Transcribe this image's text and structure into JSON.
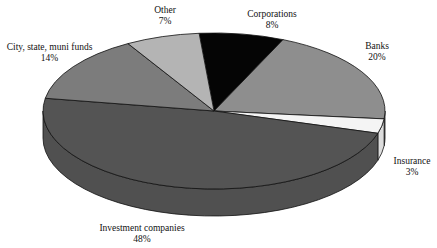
{
  "chart_data": {
    "type": "pie",
    "style": "3d",
    "title": "",
    "slices": [
      {
        "label": "Corporations",
        "value": 8,
        "display": "8%",
        "color": "#050505"
      },
      {
        "label": "Banks",
        "value": 20,
        "display": "20%",
        "color": "#8e8e8e"
      },
      {
        "label": "Insurance",
        "value": 3,
        "display": "3%",
        "color": "#f4f4f4"
      },
      {
        "label": "Investment companies",
        "value": 48,
        "display": "48%",
        "color": "#545454"
      },
      {
        "label": "City, state, muni funds",
        "value": 14,
        "display": "14%",
        "color": "#7c7c7c"
      },
      {
        "label": "Other",
        "value": 7,
        "display": "7%",
        "color": "#b4b4b4"
      }
    ],
    "legend": "none (direct labels)"
  },
  "labels": {
    "corporations": {
      "name": "Corporations",
      "pct": "8%"
    },
    "banks": {
      "name": "Banks",
      "pct": "20%"
    },
    "insurance": {
      "name": "Insurance",
      "pct": "3%"
    },
    "investment": {
      "name": "Investment companies",
      "pct": "48%"
    },
    "city": {
      "name": "City, state, muni funds",
      "pct": "14%"
    },
    "other": {
      "name": "Other",
      "pct": "7%"
    }
  }
}
